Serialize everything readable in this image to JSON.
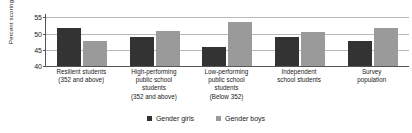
{
  "chart_data": {
    "type": "bar",
    "title": "",
    "xlabel": "",
    "ylabel": "Percent scoring high",
    "ylim": [
      40,
      56
    ],
    "yticks": [
      40,
      45,
      50,
      55
    ],
    "grid": true,
    "legend_position": "bottom-center",
    "categories": [
      "Resilient students (352 and above)",
      "High-performing public school students (352 and above)",
      "Low-performing public school students (Below 352)",
      "Independent school students",
      "Survey population"
    ],
    "category_lines": [
      [
        "Resilient students",
        "(352 and above)"
      ],
      [
        "High-performing",
        "public school",
        "students",
        "(352 and above)"
      ],
      [
        "Low-performing",
        "public school",
        "students",
        "(Below 352)"
      ],
      [
        "Independent",
        "school students"
      ],
      [
        "Survey",
        "population"
      ]
    ],
    "series": [
      {
        "name": "Gender girls",
        "color": "#333333",
        "values": [
          51.8,
          48.8,
          45.7,
          48.8,
          47.7
        ]
      },
      {
        "name": "Gender boys",
        "color": "#9a9a9a",
        "values": [
          47.8,
          50.8,
          53.6,
          50.6,
          51.6
        ]
      }
    ]
  },
  "axis": {
    "y_title": "Percent scoring high",
    "y_tick_labels": [
      "55",
      "50",
      "45",
      "40"
    ]
  },
  "legend": {
    "items": [
      {
        "label": "Gender girls",
        "color": "#333333"
      },
      {
        "label": "Gender boys",
        "color": "#9a9a9a"
      }
    ]
  },
  "colors": {
    "girls": "#333333",
    "boys": "#9a9a9a",
    "gridline": "#b9b9b9",
    "axis": "#555555",
    "text": "#1a1a1a",
    "background": "#ffffff"
  }
}
